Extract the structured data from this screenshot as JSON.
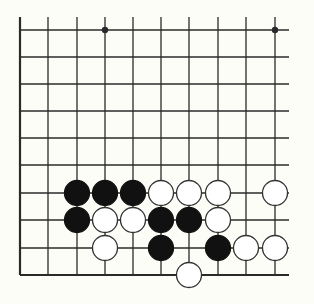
{
  "diagram": {
    "type": "go-board-fragment",
    "columns": 10,
    "rows": 10,
    "grid": {
      "x": [
        20,
        48,
        77,
        105,
        133,
        161,
        189,
        218,
        246,
        275
      ],
      "y": [
        30,
        57,
        84,
        111,
        138,
        165,
        193,
        220,
        248,
        275
      ],
      "left_edge_top": 17,
      "right_extent": 289,
      "board_edge_left": true,
      "board_edge_bottom": true
    },
    "colors": {
      "background": "#fdfdf8",
      "line": "#2a2a2a",
      "black_stone": "#111111",
      "white_stone": "#ffffff",
      "stone_outline": "#333333"
    },
    "star_points": [
      {
        "col": 3,
        "row": 0
      },
      {
        "col": 9,
        "row": 0
      }
    ],
    "stones": [
      {
        "color": "black",
        "col": 2,
        "row": 6
      },
      {
        "color": "black",
        "col": 3,
        "row": 6
      },
      {
        "color": "black",
        "col": 4,
        "row": 6
      },
      {
        "color": "white",
        "col": 5,
        "row": 6
      },
      {
        "color": "white",
        "col": 6,
        "row": 6
      },
      {
        "color": "white",
        "col": 7,
        "row": 6
      },
      {
        "color": "white",
        "col": 9,
        "row": 6
      },
      {
        "color": "black",
        "col": 2,
        "row": 7
      },
      {
        "color": "white",
        "col": 3,
        "row": 7
      },
      {
        "color": "white",
        "col": 4,
        "row": 7
      },
      {
        "color": "black",
        "col": 5,
        "row": 7
      },
      {
        "color": "black",
        "col": 6,
        "row": 7
      },
      {
        "color": "white",
        "col": 7,
        "row": 7
      },
      {
        "color": "white",
        "col": 3,
        "row": 8
      },
      {
        "color": "black",
        "col": 5,
        "row": 8
      },
      {
        "color": "black",
        "col": 7,
        "row": 8
      },
      {
        "color": "white",
        "col": 8,
        "row": 8
      },
      {
        "color": "white",
        "col": 9,
        "row": 8
      },
      {
        "color": "white",
        "col": 6,
        "row": 9
      }
    ]
  }
}
